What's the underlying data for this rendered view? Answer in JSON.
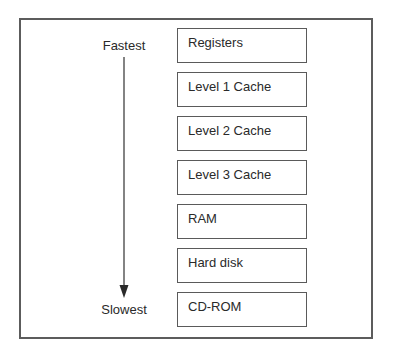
{
  "diagram": {
    "type": "memory-hierarchy",
    "speed_axis": {
      "top_label": "Fastest",
      "bottom_label": "Slowest",
      "direction": "down"
    },
    "levels": [
      {
        "label": "Registers"
      },
      {
        "label": "Level 1 Cache"
      },
      {
        "label": "Level 2 Cache"
      },
      {
        "label": "Level 3 Cache"
      },
      {
        "label": "RAM"
      },
      {
        "label": "Hard disk"
      },
      {
        "label": "CD-ROM"
      }
    ],
    "colors": {
      "stroke": "#5a5a5a",
      "text": "#2a2a2a",
      "background": "#ffffff"
    }
  }
}
